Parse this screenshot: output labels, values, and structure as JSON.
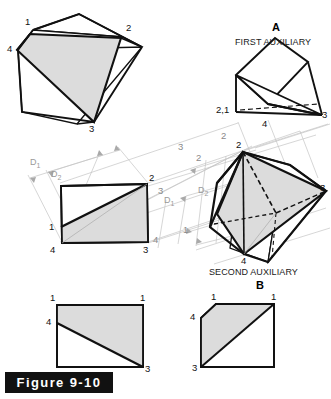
{
  "figure": {
    "caption": "Figure 9-10",
    "background_color": "#ffffff",
    "line_color": "#111111",
    "shade_color": "#dcdcdc",
    "projection_line_color": "#bfbfbf"
  },
  "views": {
    "pictorial": {
      "name": "pictorial",
      "vertex_labels": [
        "1",
        "2",
        "3",
        "4"
      ]
    },
    "front": {
      "name": "front-view",
      "vertex_labels": [
        "1",
        "2",
        "3",
        "4"
      ],
      "dimensions": [
        "D",
        "1",
        "D",
        "2"
      ],
      "dim1_label": "D",
      "dim1_sub": "1",
      "dim2_label": "D",
      "dim2_sub": "2"
    },
    "first_auxiliary": {
      "letter": "A",
      "title": "FIRST AUXILIARY",
      "vertex_labels": [
        "2,1",
        "4",
        "3"
      ]
    },
    "second_auxiliary": {
      "letter": "B",
      "title": "SECOND AUXILIARY",
      "vertex_labels": [
        "2",
        "3",
        "4",
        "1"
      ],
      "dim1_label": "D",
      "dim1_sub": "1",
      "dim2_label": "D",
      "dim2_sub": "2"
    },
    "bottom_left": {
      "name": "true-size-view-left",
      "vertex_labels": [
        "1",
        "1",
        "4",
        "3"
      ]
    },
    "bottom_right": {
      "name": "true-size-view-right",
      "vertex_labels": [
        "1",
        "1",
        "4",
        "3"
      ]
    }
  },
  "labels": {
    "pictorial_1": "1",
    "pictorial_2": "2",
    "pictorial_3": "3",
    "pictorial_4": "4",
    "front_1": "1",
    "front_2": "2",
    "front_3": "3",
    "front_4": "4",
    "aux1_21": "2,1",
    "aux1_4": "4",
    "aux1_3": "3",
    "aux2_2": "2",
    "aux2_3": "3",
    "aux2_4": "4",
    "proj_2a": "2",
    "proj_3a": "3",
    "proj_2b": "2",
    "proj_3b": "3",
    "proj_1b": "1",
    "proj_4b": "4",
    "bl_1a": "1",
    "bl_1b": "1",
    "bl_4": "4",
    "bl_3": "3",
    "br_1a": "1",
    "br_1b": "1",
    "br_4": "4",
    "br_3": "3"
  }
}
